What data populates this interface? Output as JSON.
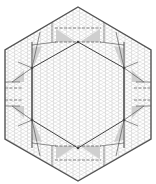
{
  "title": "Hexagonal origami crease pattern",
  "colors": {
    "background": "#ffffff",
    "grid": "#c8c8c8",
    "outline": "#555555",
    "crease": "#444444",
    "dashed": "#666666",
    "shade": "#cfcfcf"
  },
  "outer_hexagon": [
    [
      78,
      7
    ],
    [
      151,
      50
    ],
    [
      151,
      139
    ],
    [
      78,
      181
    ],
    [
      5,
      139
    ],
    [
      5,
      50
    ]
  ],
  "inner_hexagon": [
    [
      78,
      42
    ],
    [
      124,
      68
    ],
    [
      124,
      120
    ],
    [
      78,
      148
    ],
    [
      32,
      120
    ],
    [
      32,
      68
    ]
  ],
  "vertical_lines": [
    [
      [
        32,
        42
      ],
      [
        32,
        148
      ]
    ],
    [
      [
        124,
        42
      ],
      [
        124,
        148
      ]
    ]
  ],
  "solid_creases": [
    [
      [
        52,
        22
      ],
      [
        52,
        42
      ]
    ],
    [
      [
        104,
        22
      ],
      [
        104,
        42
      ]
    ],
    [
      [
        52,
        146
      ],
      [
        52,
        166
      ]
    ],
    [
      [
        104,
        146
      ],
      [
        104,
        166
      ]
    ],
    [
      [
        5,
        82
      ],
      [
        20,
        82
      ]
    ],
    [
      [
        5,
        106
      ],
      [
        20,
        106
      ]
    ],
    [
      [
        151,
        82
      ],
      [
        136,
        82
      ]
    ],
    [
      [
        151,
        106
      ],
      [
        136,
        106
      ]
    ],
    [
      [
        32,
        45
      ],
      [
        56,
        42
      ]
    ],
    [
      [
        124,
        45
      ],
      [
        100,
        42
      ]
    ],
    [
      [
        32,
        143
      ],
      [
        56,
        146
      ]
    ],
    [
      [
        124,
        143
      ],
      [
        100,
        146
      ]
    ],
    [
      [
        12,
        82
      ],
      [
        32,
        68
      ]
    ],
    [
      [
        12,
        106
      ],
      [
        32,
        120
      ]
    ],
    [
      [
        144,
        82
      ],
      [
        124,
        68
      ]
    ],
    [
      [
        144,
        106
      ],
      [
        124,
        120
      ]
    ],
    [
      [
        40,
        32
      ],
      [
        32,
        68
      ]
    ],
    [
      [
        116,
        32
      ],
      [
        124,
        68
      ]
    ],
    [
      [
        40,
        156
      ],
      [
        32,
        120
      ]
    ],
    [
      [
        116,
        156
      ],
      [
        124,
        120
      ]
    ],
    [
      [
        18,
        62
      ],
      [
        32,
        68
      ]
    ],
    [
      [
        138,
        62
      ],
      [
        124,
        68
      ]
    ],
    [
      [
        18,
        126
      ],
      [
        32,
        120
      ]
    ],
    [
      [
        138,
        126
      ],
      [
        124,
        120
      ]
    ]
  ],
  "dashed_creases": [
    [
      [
        55,
        28
      ],
      [
        101,
        28
      ]
    ],
    [
      [
        55,
        42
      ],
      [
        101,
        42
      ]
    ],
    [
      [
        55,
        146
      ],
      [
        101,
        146
      ]
    ],
    [
      [
        55,
        160
      ],
      [
        101,
        160
      ]
    ],
    [
      [
        5,
        88
      ],
      [
        22,
        88
      ]
    ],
    [
      [
        5,
        100
      ],
      [
        22,
        100
      ]
    ],
    [
      [
        134,
        88
      ],
      [
        151,
        88
      ]
    ],
    [
      [
        134,
        100
      ],
      [
        151,
        100
      ]
    ]
  ],
  "shaded_triangles": [
    [
      [
        56,
        29
      ],
      [
        56,
        42
      ],
      [
        76,
        42
      ]
    ],
    [
      [
        100,
        29
      ],
      [
        100,
        42
      ],
      [
        80,
        42
      ]
    ],
    [
      [
        56,
        159
      ],
      [
        56,
        146
      ],
      [
        76,
        146
      ]
    ],
    [
      [
        100,
        159
      ],
      [
        100,
        146
      ],
      [
        80,
        146
      ]
    ],
    [
      [
        32,
        48
      ],
      [
        34,
        66
      ],
      [
        42,
        46
      ]
    ],
    [
      [
        124,
        48
      ],
      [
        122,
        66
      ],
      [
        114,
        46
      ]
    ],
    [
      [
        32,
        140
      ],
      [
        34,
        122
      ],
      [
        42,
        142
      ]
    ],
    [
      [
        124,
        140
      ],
      [
        122,
        122
      ],
      [
        114,
        142
      ]
    ],
    [
      [
        12,
        82
      ],
      [
        24,
        70
      ],
      [
        24,
        82
      ]
    ],
    [
      [
        144,
        82
      ],
      [
        132,
        70
      ],
      [
        132,
        82
      ]
    ],
    [
      [
        12,
        106
      ],
      [
        24,
        118
      ],
      [
        24,
        106
      ]
    ],
    [
      [
        144,
        106
      ],
      [
        132,
        118
      ],
      [
        132,
        106
      ]
    ]
  ],
  "nodes": [
    [
      78,
      42
    ],
    [
      78,
      148
    ],
    [
      32,
      68
    ],
    [
      124,
      68
    ],
    [
      32,
      120
    ],
    [
      124,
      120
    ]
  ]
}
